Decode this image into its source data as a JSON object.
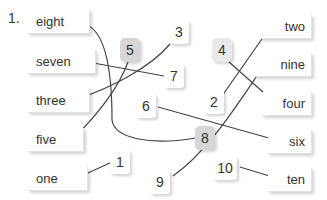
{
  "exercise": {
    "number": "1.",
    "left_words": [
      {
        "label": "eight",
        "x": 28,
        "y": 10
      },
      {
        "label": "seven",
        "x": 28,
        "y": 50
      },
      {
        "label": "three",
        "x": 28,
        "y": 89
      },
      {
        "label": "five",
        "x": 28,
        "y": 128
      },
      {
        "label": "one",
        "x": 28,
        "y": 167
      }
    ],
    "right_words": [
      {
        "label": "two",
        "x": 255,
        "y": 15
      },
      {
        "label": "nine",
        "x": 255,
        "y": 53
      },
      {
        "label": "four",
        "x": 255,
        "y": 92
      },
      {
        "label": "six",
        "x": 255,
        "y": 130
      },
      {
        "label": "ten",
        "x": 255,
        "y": 168
      }
    ],
    "numbers": [
      {
        "label": "5",
        "x": 120,
        "y": 38,
        "highlighted": true
      },
      {
        "label": "3",
        "x": 169,
        "y": 22,
        "highlighted": false
      },
      {
        "label": "7",
        "x": 165,
        "y": 64,
        "highlighted": false
      },
      {
        "label": "6",
        "x": 138,
        "y": 94,
        "highlighted": false
      },
      {
        "label": "8",
        "x": 195,
        "y": 126,
        "highlighted": true
      },
      {
        "label": "1",
        "x": 112,
        "y": 150,
        "highlighted": false
      },
      {
        "label": "9",
        "x": 150,
        "y": 170,
        "highlighted": false
      },
      {
        "label": "4",
        "x": 213,
        "y": 38,
        "highlighted": false
      },
      {
        "label": "2",
        "x": 204,
        "y": 90,
        "highlighted": false
      },
      {
        "label": "10",
        "x": 213,
        "y": 158,
        "highlighted": false
      }
    ],
    "connections": [
      [
        "eight",
        "8"
      ],
      [
        "seven",
        "7"
      ],
      [
        "three",
        "3"
      ],
      [
        "five",
        "5"
      ],
      [
        "one",
        "1"
      ],
      [
        "two",
        "2"
      ],
      [
        "nine",
        "9"
      ],
      [
        "four",
        "4"
      ],
      [
        "six",
        "6"
      ],
      [
        "ten",
        "10"
      ]
    ]
  }
}
